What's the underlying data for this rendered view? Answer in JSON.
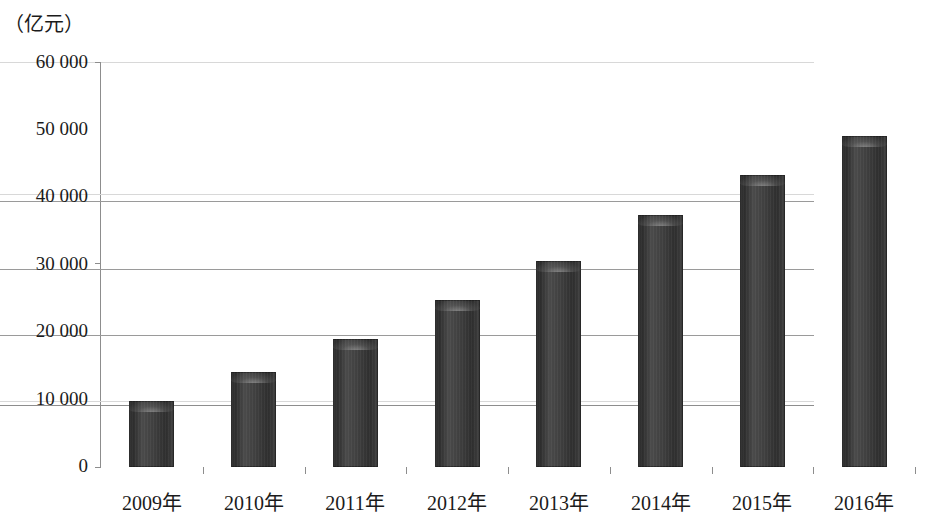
{
  "chart_data": {
    "type": "bar",
    "title": "",
    "subtitle": "",
    "unit_label": "（亿元）",
    "xlabel": "",
    "ylabel": "",
    "categories": [
      "2009年",
      "2010年",
      "2011年",
      "2012年",
      "2013年",
      "2014年",
      "2015年",
      "2016年"
    ],
    "values": [
      9800,
      14000,
      19000,
      24800,
      30500,
      37300,
      43200,
      49000
    ],
    "ylim": [
      0,
      60000
    ],
    "ytick_labels": [
      "0",
      "10 000",
      "20 000",
      "30 000",
      "40 000",
      "50 000",
      "60 000"
    ],
    "ytick_values": [
      0,
      10000,
      20000,
      30000,
      40000,
      50000,
      60000
    ],
    "grid": true,
    "legend": false,
    "bar_color": "#3a3a3a",
    "gridline_color": "#9a9a9a",
    "axis_color": "#8d8d8d",
    "text_color": "#1b1b1b"
  }
}
